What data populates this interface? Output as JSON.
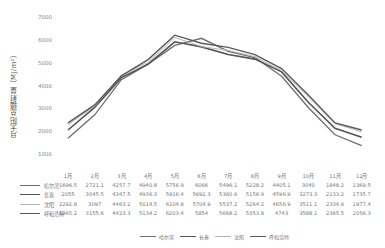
{
  "chart_data": {
    "type": "line",
    "title": "",
    "xlabel": "",
    "ylabel": "月太阳总辐射量（MJ/m²）",
    "ylim": [
      0,
      7000
    ],
    "yticks": [
      0,
      1000,
      2000,
      3000,
      4000,
      5000,
      6000,
      7000
    ],
    "grid": false,
    "legend_position": "bottom",
    "categories": [
      "1月",
      "2月",
      "3月",
      "4月",
      "5月",
      "6月",
      "7月",
      "8月",
      "9月",
      "10月",
      "11月",
      "12月"
    ],
    "series": [
      {
        "name": "哈尔滨",
        "color": "#6e6e6e",
        "values": [
          1696.5,
          2721.1,
          4257.7,
          4940.8,
          5756.9,
          6066,
          5496.1,
          5228.2,
          4405.1,
          3040,
          1848.2,
          1369.5
        ]
      },
      {
        "name": "长春",
        "color": "#555555",
        "values": [
          2055,
          3045.5,
          4347.5,
          4936.3,
          5916.4,
          5692.3,
          5360.6,
          5158.9,
          4596.9,
          3273.3,
          2133.2,
          1735.7
        ]
      },
      {
        "name": "沈阳",
        "color": "#b5b5b5",
        "values": [
          2292.8,
          3097,
          4463.2,
          5014.5,
          6104.8,
          5704.9,
          5537.2,
          5264.2,
          4656.9,
          3511.1,
          2334.6,
          1977.4
        ]
      },
      {
        "name": "呼和浩特",
        "color": "#5a5a5a",
        "values": [
          2365.2,
          3155.6,
          4423.3,
          5134.2,
          6203.4,
          5854,
          5668.2,
          5353.8,
          4743,
          3588.1,
          2365.5,
          2056.3
        ]
      }
    ],
    "table": {
      "header": [
        "1月",
        "2月",
        "3月",
        "4月",
        "5月",
        "6月",
        "7月",
        "8月",
        "9月",
        "10月",
        "11月",
        "12月"
      ],
      "rows": [
        {
          "label": "哈尔滨",
          "cells": [
            "1696.5",
            "2721.1",
            "4257.7",
            "4940.8",
            "5756.9",
            "6066",
            "5496.1",
            "5228.2",
            "4405.1",
            "3040",
            "1848.2",
            "1369.5"
          ]
        },
        {
          "label": "长春",
          "cells": [
            "2055",
            "3045.5",
            "4347.5",
            "4936.3",
            "5916.4",
            "5692.3",
            "5360.6",
            "5158.9",
            "4596.9",
            "3273.3",
            "2133.2",
            "1735.7"
          ]
        },
        {
          "label": "沈阳",
          "cells": [
            "2292.8",
            "3097",
            "4463.2",
            "5014.5",
            "6104.8",
            "5704.9",
            "5537.2",
            "5264.2",
            "4656.9",
            "3511.1",
            "2334.6",
            "1977.4"
          ]
        },
        {
          "label": "呼和浩特",
          "cells": [
            "2365.2",
            "3155.6",
            "4423.3",
            "5134.2",
            "6203.4",
            "5854",
            "5668.2",
            "5353.8",
            "4743",
            "3588.1",
            "2365.5",
            "2056.3"
          ]
        }
      ]
    }
  },
  "legend": [
    "哈尔滨",
    "长春",
    "沈阳",
    "呼和浩特"
  ]
}
